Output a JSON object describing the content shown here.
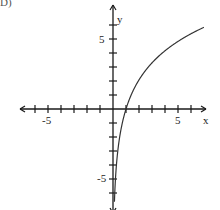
{
  "problem_label": "D)",
  "chart_data": {
    "type": "line",
    "title": "",
    "function": "y = 3 ln(x)",
    "xlabel": "x",
    "ylabel": "y",
    "xlim": [
      -7,
      7
    ],
    "ylim": [
      -7,
      7
    ],
    "x_tick_labels": [
      "-5",
      "5"
    ],
    "y_tick_labels": [
      "5",
      "-5"
    ],
    "tick_step": 1,
    "grid": false,
    "series": [
      {
        "name": "curve",
        "x": [
          0.11,
          0.15,
          0.2,
          0.3,
          0.5,
          0.75,
          1,
          1.5,
          2,
          3,
          4,
          5,
          6,
          7
        ],
        "y": [
          -6.6,
          -5.7,
          -4.8,
          -3.6,
          -2.1,
          -0.9,
          0,
          1.2,
          2.1,
          3.3,
          4.2,
          4.8,
          5.4,
          5.8
        ]
      }
    ],
    "colors": {
      "axis": "#1a1a1a",
      "curve": "#333333"
    }
  }
}
